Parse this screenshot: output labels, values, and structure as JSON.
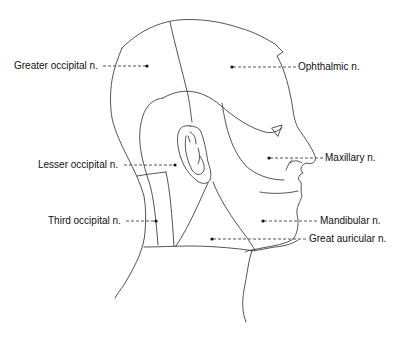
{
  "diagram": {
    "labels": [
      {
        "id": "greater-occipital",
        "text": "Greater occipital n.",
        "side": "left"
      },
      {
        "id": "ophthalmic",
        "text": "Ophthalmic n.",
        "side": "right"
      },
      {
        "id": "lesser-occipital",
        "text": "Lesser occipital n.",
        "side": "left"
      },
      {
        "id": "maxillary",
        "text": "Maxillary n.",
        "side": "right"
      },
      {
        "id": "third-occipital",
        "text": "Third occipital n.",
        "side": "left"
      },
      {
        "id": "mandibular",
        "text": "Mandibular n.",
        "side": "right"
      },
      {
        "id": "great-auricular",
        "text": "Great auricular n.",
        "side": "right"
      }
    ]
  },
  "colors": {
    "line": "#2a2a2a",
    "text": "#111111",
    "background": "#ffffff"
  }
}
